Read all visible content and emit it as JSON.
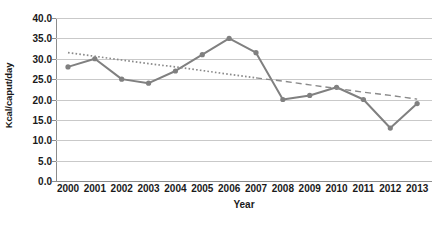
{
  "chart_data": {
    "type": "line",
    "title": "",
    "xlabel": "Year",
    "ylabel": "Kcal/caput/day",
    "categories": [
      "2000",
      "2001",
      "2002",
      "2003",
      "2004",
      "2005",
      "2006",
      "2007",
      "2008",
      "2009",
      "2010",
      "2011",
      "2012",
      "2013"
    ],
    "ylim": [
      0.0,
      40.0
    ],
    "yticks": [
      "0.0",
      "5.0",
      "10.0",
      "15.0",
      "20.0",
      "25.0",
      "30.0",
      "35.0",
      "40.0"
    ],
    "ytick_values": [
      0.0,
      5.0,
      10.0,
      15.0,
      20.0,
      25.0,
      30.0,
      35.0,
      40.0
    ],
    "grid": true,
    "legend": "none",
    "series": [
      {
        "name": "Kcal/caput/day",
        "style": "solid-with-markers",
        "color": "#808080",
        "values": [
          28.0,
          30.0,
          25.0,
          24.0,
          27.0,
          31.0,
          35.0,
          31.5,
          20.0,
          21.0,
          23.0,
          20.0,
          13.0,
          19.0
        ]
      },
      {
        "name": "Linear trend",
        "style": "dashed-trendline",
        "color": "#8a8a8a",
        "values": [
          31.5,
          30.6,
          29.7,
          28.8,
          28.0,
          27.1,
          26.2,
          25.3,
          24.5,
          23.6,
          22.7,
          21.8,
          21.0,
          20.1
        ]
      }
    ]
  },
  "axis": {
    "y_title": "Kcal/caput/day",
    "x_title": "Year"
  },
  "colors": {
    "series": "#808080",
    "trendline": "#8a8a8a",
    "gridline": "#c9c9c9",
    "axis": "#8c8c8c",
    "text": "#1a1a1a",
    "background": "#ffffff"
  }
}
